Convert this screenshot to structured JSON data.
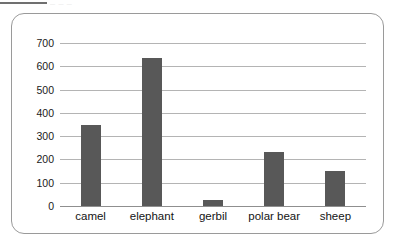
{
  "artifact": {
    "ghost_text": "— — —"
  },
  "chart_data": {
    "type": "bar",
    "title": "",
    "subtitle": "",
    "xlabel": "",
    "ylabel": "",
    "categories": [
      "camel",
      "elephant",
      "gerbil",
      "polar bear",
      "sheep"
    ],
    "values": [
      350,
      635,
      25,
      230,
      150
    ],
    "series": [
      {
        "name": "",
        "values": [
          350,
          635,
          25,
          230,
          150
        ]
      }
    ],
    "ylim": [
      0,
      700
    ],
    "yticks": [
      0,
      100,
      200,
      300,
      400,
      500,
      600,
      700
    ],
    "ytick_labels": [
      "0",
      "100",
      "200",
      "300",
      "400",
      "500",
      "600",
      "700"
    ],
    "grid": "horizontal",
    "legend": "none",
    "bar_color": "#585858",
    "gridline_color": "#b4b4b4",
    "axis_color": "#8f8f8f",
    "frame_color": "#9a9a9a",
    "background": "#ffffff"
  }
}
